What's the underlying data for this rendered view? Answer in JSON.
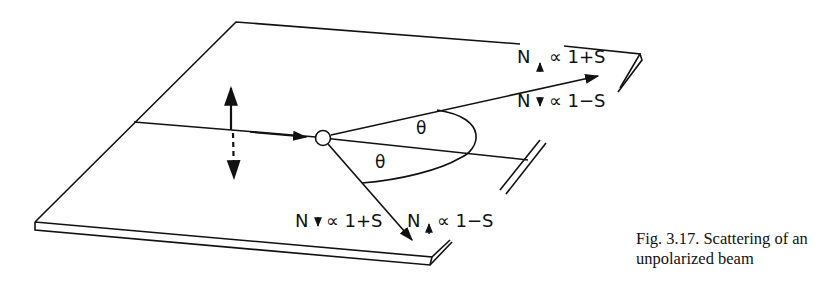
{
  "diagram": {
    "labels": {
      "upper_right_top": {
        "N": "N",
        "rel": "∝ 1+S",
        "spin": "up"
      },
      "upper_right_bottom": {
        "N": "N",
        "rel": "∝ 1−S",
        "spin": "down"
      },
      "lower_left": {
        "N": "N",
        "rel": "∝ 1+S",
        "spin": "down"
      },
      "lower_right": {
        "N": "N",
        "rel": "∝ 1−S",
        "spin": "up"
      },
      "theta_upper": "θ",
      "theta_lower": "θ"
    },
    "elements": [
      "tilted-plate",
      "incident-beam",
      "spin-up-arrow",
      "spin-down-dashed-arrow",
      "scattering-target",
      "scattered-beam-upper",
      "scattered-beam-lower",
      "angle-arc"
    ]
  },
  "caption": {
    "line1": "Fig. 3.17. Scattering of an",
    "line2": "unpolarized beam"
  }
}
